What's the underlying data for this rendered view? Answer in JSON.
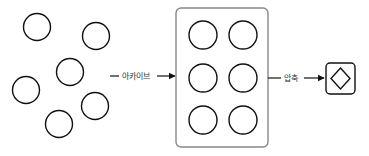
{
  "diagram": {
    "loose_items": {
      "label": "scattered files",
      "count": 6
    },
    "archive_arrow": {
      "label": "아카이브"
    },
    "archive_box": {
      "label": "archive container",
      "count": 6
    },
    "compress_arrow": {
      "label": "압축"
    },
    "result": {
      "label": "compressed archive",
      "icon": "diamond-icon"
    }
  },
  "colors": {
    "stroke": "#111111",
    "box_border": "#888888",
    "text": "#333333"
  }
}
